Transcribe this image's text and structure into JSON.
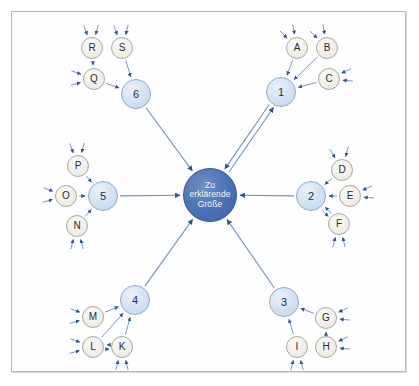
{
  "diagram": {
    "type": "causal-hub-and-spoke",
    "title_text": "",
    "frame": {
      "border_color": "#b8b8b8",
      "background": "#fefefe"
    },
    "colors": {
      "hub_fill": "#4a71b4",
      "hub_border": "#2f5496",
      "hub_text": "#ffffff",
      "number_fill": "#cfe0f2",
      "number_border": "#8fa9c8",
      "letter_fill": "#f0eee7",
      "letter_border": "#a8a8a0",
      "arrow_inner": "#6f91c4",
      "arrow_outer": "#2f5496",
      "frame_border": "#b8b8b8"
    },
    "hub": {
      "id": "hub",
      "label_lines": [
        "Zu",
        "erklärende",
        "Größe"
      ],
      "line1": "Zu",
      "line2": "erklärende",
      "line3": "Größe",
      "cx": 210,
      "cy": 195,
      "r": 27
    },
    "primary_nodes": [
      {
        "id": "n1",
        "label": "1",
        "cx": 281,
        "cy": 92,
        "r": 15
      },
      {
        "id": "n2",
        "label": "2",
        "cx": 311,
        "cy": 196,
        "r": 15
      },
      {
        "id": "n3",
        "label": "3",
        "cx": 284,
        "cy": 302,
        "r": 15
      },
      {
        "id": "n4",
        "label": "4",
        "cx": 135,
        "cy": 300,
        "r": 15
      },
      {
        "id": "n5",
        "label": "5",
        "cx": 103,
        "cy": 196,
        "r": 15
      },
      {
        "id": "n6",
        "label": "6",
        "cx": 136,
        "cy": 94,
        "r": 15
      }
    ],
    "secondary_nodes": [
      {
        "id": "A",
        "label": "A",
        "cx": 297,
        "cy": 48,
        "r": 11,
        "cluster": "n1"
      },
      {
        "id": "B",
        "label": "B",
        "cx": 327,
        "cy": 48,
        "r": 11,
        "cluster": "n1"
      },
      {
        "id": "C",
        "label": "C",
        "cx": 329,
        "cy": 79,
        "r": 11,
        "cluster": "n1"
      },
      {
        "id": "D",
        "label": "D",
        "cx": 342,
        "cy": 170,
        "r": 11,
        "cluster": "n2"
      },
      {
        "id": "E",
        "label": "E",
        "cx": 350,
        "cy": 196,
        "r": 11,
        "cluster": "n2"
      },
      {
        "id": "F",
        "label": "F",
        "cx": 339,
        "cy": 224,
        "r": 11,
        "cluster": "n2"
      },
      {
        "id": "G",
        "label": "G",
        "cx": 326,
        "cy": 318,
        "r": 11,
        "cluster": "n3"
      },
      {
        "id": "H",
        "label": "H",
        "cx": 326,
        "cy": 347,
        "r": 11,
        "cluster": "n3"
      },
      {
        "id": "I",
        "label": "I",
        "cx": 297,
        "cy": 347,
        "r": 11,
        "cluster": "n3"
      },
      {
        "id": "K",
        "label": "K",
        "cx": 122,
        "cy": 347,
        "r": 11,
        "cluster": "n4"
      },
      {
        "id": "L",
        "label": "L",
        "cx": 93,
        "cy": 347,
        "r": 11,
        "cluster": "n4"
      },
      {
        "id": "M",
        "label": "M",
        "cx": 93,
        "cy": 317,
        "r": 11,
        "cluster": "n4"
      },
      {
        "id": "N",
        "label": "N",
        "cx": 77,
        "cy": 226,
        "r": 11,
        "cluster": "n5"
      },
      {
        "id": "O",
        "label": "O",
        "cx": 66,
        "cy": 196,
        "r": 11,
        "cluster": "n5"
      },
      {
        "id": "P",
        "label": "P",
        "cx": 78,
        "cy": 166,
        "r": 11,
        "cluster": "n5"
      },
      {
        "id": "Q",
        "label": "Q",
        "cx": 94,
        "cy": 79,
        "r": 11,
        "cluster": "n6"
      },
      {
        "id": "R",
        "label": "R",
        "cx": 92,
        "cy": 48,
        "r": 11,
        "cluster": "n6"
      },
      {
        "id": "S",
        "label": "S",
        "cx": 122,
        "cy": 48,
        "r": 11,
        "cluster": "n6"
      }
    ],
    "edges": [
      {
        "from": "n1",
        "to": "hub",
        "bidirectional": true
      },
      {
        "from": "n2",
        "to": "hub",
        "bidirectional": false
      },
      {
        "from": "n3",
        "to": "hub",
        "bidirectional": false
      },
      {
        "from": "n4",
        "to": "hub",
        "bidirectional": false
      },
      {
        "from": "n5",
        "to": "hub",
        "bidirectional": false
      },
      {
        "from": "n6",
        "to": "hub",
        "bidirectional": false
      },
      {
        "from": "A",
        "to": "n1",
        "bidirectional": false
      },
      {
        "from": "B",
        "to": "n1",
        "bidirectional": false
      },
      {
        "from": "C",
        "to": "n1",
        "bidirectional": false
      },
      {
        "from": "D",
        "to": "n2",
        "bidirectional": false
      },
      {
        "from": "E",
        "to": "n2",
        "bidirectional": false
      },
      {
        "from": "F",
        "to": "n2",
        "bidirectional": true
      },
      {
        "from": "G",
        "to": "n3",
        "bidirectional": false
      },
      {
        "from": "I",
        "to": "n3",
        "bidirectional": false
      },
      {
        "from": "H",
        "to": "G",
        "bidirectional": false
      },
      {
        "from": "M",
        "to": "n4",
        "bidirectional": false
      },
      {
        "from": "K",
        "to": "n4",
        "bidirectional": false
      },
      {
        "from": "L",
        "to": "n4",
        "bidirectional": false
      },
      {
        "from": "K",
        "to": "L",
        "bidirectional": true
      },
      {
        "from": "P",
        "to": "n5",
        "bidirectional": false
      },
      {
        "from": "O",
        "to": "n5",
        "bidirectional": false
      },
      {
        "from": "N",
        "to": "n5",
        "bidirectional": false
      },
      {
        "from": "S",
        "to": "n6",
        "bidirectional": false
      },
      {
        "from": "Q",
        "to": "n6",
        "bidirectional": false
      },
      {
        "from": "R",
        "to": "Q",
        "bidirectional": false
      }
    ],
    "external_stubs": [
      {
        "target": "A",
        "angle": 225
      },
      {
        "target": "A",
        "angle": 260
      },
      {
        "target": "B",
        "angle": 225
      },
      {
        "target": "B",
        "angle": 260
      },
      {
        "target": "C",
        "angle": 5
      },
      {
        "target": "C",
        "angle": 335
      },
      {
        "target": "D",
        "angle": 240
      },
      {
        "target": "D",
        "angle": 285
      },
      {
        "target": "E",
        "angle": 5
      },
      {
        "target": "E",
        "angle": 335
      },
      {
        "target": "F",
        "angle": 75
      },
      {
        "target": "F",
        "angle": 105
      },
      {
        "target": "G",
        "angle": 5
      },
      {
        "target": "G",
        "angle": 335
      },
      {
        "target": "H",
        "angle": 5
      },
      {
        "target": "H",
        "angle": 335
      },
      {
        "target": "I",
        "angle": 75
      },
      {
        "target": "I",
        "angle": 105
      },
      {
        "target": "K",
        "angle": 75
      },
      {
        "target": "K",
        "angle": 105
      },
      {
        "target": "L",
        "angle": 165
      },
      {
        "target": "L",
        "angle": 200
      },
      {
        "target": "M",
        "angle": 165
      },
      {
        "target": "M",
        "angle": 200
      },
      {
        "target": "N",
        "angle": 75
      },
      {
        "target": "N",
        "angle": 105
      },
      {
        "target": "O",
        "angle": 165
      },
      {
        "target": "O",
        "angle": 200
      },
      {
        "target": "P",
        "angle": 250
      },
      {
        "target": "P",
        "angle": 285
      },
      {
        "target": "Q",
        "angle": 165
      },
      {
        "target": "Q",
        "angle": 200
      },
      {
        "target": "R",
        "angle": 250
      },
      {
        "target": "R",
        "angle": 285
      },
      {
        "target": "S",
        "angle": 250
      },
      {
        "target": "S",
        "angle": 285
      }
    ]
  }
}
